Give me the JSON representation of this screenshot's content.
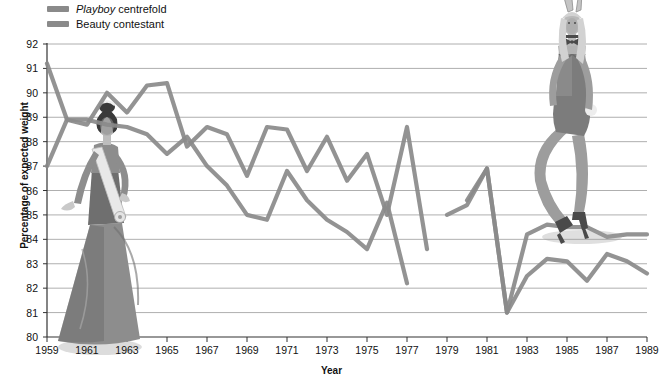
{
  "legend": {
    "items": [
      {
        "name": "Playboy centrefold",
        "emphasis": "Playboy",
        "rest": " centrefold",
        "color": "#8a8a8a"
      },
      {
        "name": "Beauty contestant",
        "emphasis": "",
        "rest": "Beauty contestant",
        "color": "#8a8a8a"
      }
    ]
  },
  "axes": {
    "ylabel": "Percentage of expected weight",
    "xlabel": "Year",
    "yticks": [
      80,
      81,
      82,
      83,
      84,
      85,
      86,
      87,
      88,
      89,
      90,
      91,
      92
    ],
    "xticks": [
      1959,
      1961,
      1963,
      1965,
      1967,
      1969,
      1971,
      1973,
      1975,
      1977,
      1979,
      1981,
      1983,
      1985,
      1987,
      1989
    ]
  },
  "figures": [
    {
      "name": "beauty-contestant-illustration",
      "caption": "Victorian beauty pageant contestant in long gown with sash"
    },
    {
      "name": "playboy-centrefold-illustration",
      "caption": "Playboy bunny in costume with ears, bowtie and heels"
    }
  ],
  "chart_data": {
    "type": "line",
    "title": "",
    "xlabel": "Year",
    "ylabel": "Percentage of expected weight",
    "xlim": [
      1959,
      1989
    ],
    "ylim": [
      80,
      92
    ],
    "grid": true,
    "legend_position": "top-left",
    "x": [
      1959,
      1960,
      1961,
      1962,
      1963,
      1964,
      1965,
      1966,
      1967,
      1968,
      1969,
      1970,
      1971,
      1972,
      1973,
      1974,
      1975,
      1976,
      1977,
      1978,
      1979,
      1980,
      1981,
      1982,
      1983,
      1984,
      1985,
      1986,
      1987,
      1988,
      1989
    ],
    "series": [
      {
        "name": "Playboy centrefold",
        "color": "#8a8a8a",
        "values": [
          91.2,
          88.9,
          88.7,
          90.0,
          89.2,
          90.3,
          90.4,
          87.8,
          88.6,
          88.3,
          86.6,
          88.6,
          88.5,
          86.8,
          88.2,
          86.4,
          87.5,
          85.0,
          88.6,
          83.6,
          null,
          85.6,
          86.9,
          81.0,
          84.2,
          84.6,
          84.5,
          84.5,
          84.1,
          84.2,
          84.2
        ]
      },
      {
        "name": "Beauty contestant",
        "color": "#8a8a8a",
        "values": [
          87.0,
          88.9,
          88.9,
          88.7,
          88.6,
          88.3,
          87.5,
          88.2,
          87.0,
          86.2,
          85.0,
          84.8,
          86.8,
          85.6,
          84.8,
          84.3,
          83.6,
          85.5,
          82.2,
          null,
          85.0,
          85.4,
          86.9,
          81.0,
          82.5,
          83.2,
          83.1,
          82.3,
          83.4,
          83.1,
          82.6
        ]
      }
    ]
  }
}
